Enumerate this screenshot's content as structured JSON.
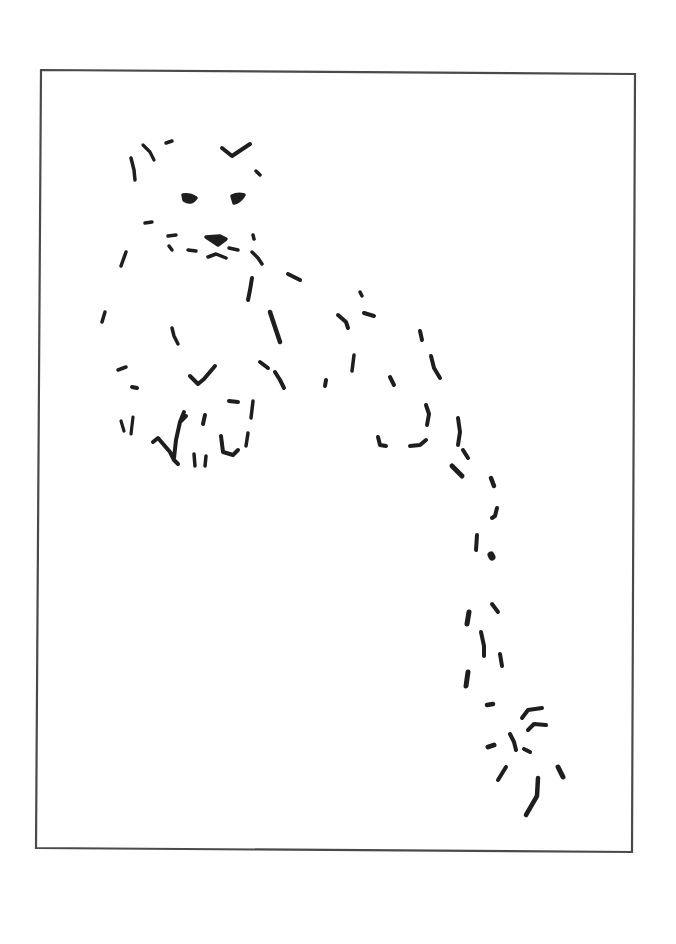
{
  "image": {
    "title": "Minimalist line sketch of a reclining snow leopard",
    "background": "#ffffff",
    "ink_color": "#1e1e1e",
    "frame_color": "#4a4a4a",
    "frame": {
      "points": [
        [
          41,
          70
        ],
        [
          635,
          74
        ],
        [
          632,
          852
        ],
        [
          36,
          848
        ]
      ],
      "stroke_width": 2.2
    },
    "strokes": [
      {
        "part": "ear-left",
        "d": "M131 158 L134 170 L135 180",
        "w": 3.5
      },
      {
        "part": "ear-left-2",
        "d": "M143 145 L150 152 L154 160",
        "w": 3.2
      },
      {
        "part": "ear-left-tip",
        "d": "M166 143 L172 141",
        "w": 3.5
      },
      {
        "part": "ear-right",
        "d": "M222 148 L232 156 L238 152 L250 144",
        "w": 4
      },
      {
        "part": "ear-right-dot",
        "d": "M256 171 L260 175",
        "w": 3.5
      },
      {
        "part": "eye-left",
        "d": "M183 195 Q190 194 196 198 Q191 205 184 200 Z",
        "w": 3.5
      },
      {
        "part": "eye-right",
        "d": "M232 196 Q238 193 244 195 Q240 202 234 203 Z",
        "w": 3.5
      },
      {
        "part": "cheek-dot",
        "d": "M145 223 L152 222",
        "w": 3.5
      },
      {
        "part": "whisker-l1",
        "d": "M168 236 L176 235",
        "w": 3.5
      },
      {
        "part": "whisker-l2",
        "d": "M169 246 L172 250",
        "w": 3.5
      },
      {
        "part": "whisker-l3",
        "d": "M188 250 L196 251",
        "w": 3.5
      },
      {
        "part": "nose",
        "d": "M206 237 L220 236 L226 239 L218 245 L212 241 Z",
        "w": 3.5
      },
      {
        "part": "nose-right",
        "d": "M229 248 L238 250",
        "w": 3.5
      },
      {
        "part": "mouth",
        "d": "M208 257 L216 254 L226 258",
        "w": 3.5
      },
      {
        "part": "whisker-r",
        "d": "M253 235 L254 239",
        "w": 3.5
      },
      {
        "part": "cheek-left",
        "d": "M126 252 L121 266",
        "w": 3.5
      },
      {
        "part": "jaw-right",
        "d": "M252 252 L258 258 L262 264",
        "w": 3.5
      },
      {
        "part": "neck-dot",
        "d": "M288 274 L300 280",
        "w": 4
      },
      {
        "part": "chest-1",
        "d": "M252 278 L250 290 L248 300",
        "w": 4
      },
      {
        "part": "chest-2",
        "d": "M270 312 L276 330 L280 342",
        "w": 4.5
      },
      {
        "part": "side-left",
        "d": "M105 312 L102 322",
        "w": 3.5
      },
      {
        "part": "body-mid",
        "d": "M172 328 L174 336 L178 344",
        "w": 3.5
      },
      {
        "part": "paw-mark-1",
        "d": "M118 370 L126 367",
        "w": 3.5
      },
      {
        "part": "paw-mark-2",
        "d": "M132 387 L137 388",
        "w": 4
      },
      {
        "part": "paw-v",
        "d": "M190 376 L198 384 L204 379 L215 366",
        "w": 4
      },
      {
        "part": "leg-1",
        "d": "M260 362 L268 368",
        "w": 4
      },
      {
        "part": "leg-2",
        "d": "M275 372 L280 380 L284 388",
        "w": 4
      },
      {
        "part": "paw-dash",
        "d": "M229 401 L238 402",
        "w": 4
      },
      {
        "part": "paw-line",
        "d": "M253 401 L251 418",
        "w": 3.5
      },
      {
        "part": "toe-1",
        "d": "M121 421 L124 431",
        "w": 3.2
      },
      {
        "part": "toe-2",
        "d": "M133 417 L131 434",
        "w": 3.2
      },
      {
        "part": "toe-branch",
        "d": "M153 442 L158 438 L164 445 L170 452 L174 460 L178 464 M174 458 L176 440 L180 422 L186 416 M180 422 L184 412",
        "w": 4
      },
      {
        "part": "toe-3",
        "d": "M205 415 L203 424",
        "w": 4
      },
      {
        "part": "toe-4",
        "d": "M194 454 L195 466 M206 456 L205 466",
        "w": 3.5
      },
      {
        "part": "toe-5",
        "d": "M221 436 L223 452 L233 455 L238 450",
        "w": 4
      },
      {
        "part": "toe-6",
        "d": "M248 433 L246 446",
        "w": 3.5
      },
      {
        "part": "back-1",
        "d": "M360 292 L362 296",
        "w": 3.5
      },
      {
        "part": "back-2",
        "d": "M338 315 L346 322 L348 328",
        "w": 4
      },
      {
        "part": "back-3",
        "d": "M364 313 L374 316",
        "w": 4
      },
      {
        "part": "hip-1",
        "d": "M420 331 L422 340",
        "w": 4
      },
      {
        "part": "hip-2",
        "d": "M431 356 L434 368 L440 378",
        "w": 4
      },
      {
        "part": "flank-1",
        "d": "M354 355 L352 371",
        "w": 3.5
      },
      {
        "part": "flank-2",
        "d": "M326 380 L325 386",
        "w": 4
      },
      {
        "part": "flank-3",
        "d": "M390 377 L394 385",
        "w": 4
      },
      {
        "part": "hind-1",
        "d": "M426 405 L429 414 L427 425",
        "w": 4
      },
      {
        "part": "hind-2",
        "d": "M458 418 L460 432 L458 445",
        "w": 4
      },
      {
        "part": "hind-3",
        "d": "M463 450 L468 458",
        "w": 4
      },
      {
        "part": "foot-1",
        "d": "M378 437 L380 445 L386 446",
        "w": 4
      },
      {
        "part": "foot-2",
        "d": "M410 446 L420 445 L426 440",
        "w": 4
      },
      {
        "part": "tail-1",
        "d": "M452 466 L462 476",
        "w": 5
      },
      {
        "part": "tail-2",
        "d": "M491 478 L494 486",
        "w": 4.5
      },
      {
        "part": "tail-3",
        "d": "M497 508 L495 516 L492 518",
        "w": 4
      },
      {
        "part": "tail-4",
        "d": "M477 535 L476 550",
        "w": 4
      },
      {
        "part": "tail-5",
        "d": "M491 555 L492 557",
        "w": 7
      },
      {
        "part": "tail-6",
        "d": "M492 604 L498 612",
        "w": 4
      },
      {
        "part": "tail-7",
        "d": "M469 612 L467 624",
        "w": 5
      },
      {
        "part": "tail-8",
        "d": "M481 632 L484 646 L484 656",
        "w": 4
      },
      {
        "part": "tail-9",
        "d": "M500 654 L502 666",
        "w": 4
      },
      {
        "part": "tail-10",
        "d": "M468 672 L466 686",
        "w": 5
      },
      {
        "part": "tail-11",
        "d": "M487 705 L493 704",
        "w": 4.5
      },
      {
        "part": "tail-tip-1",
        "d": "M522 718 L528 710 L542 708",
        "w": 4
      },
      {
        "part": "tail-tip-2",
        "d": "M528 730 L534 724 L546 725",
        "w": 4
      },
      {
        "part": "tail-tip-3",
        "d": "M510 734 L514 742 L516 750",
        "w": 4
      },
      {
        "part": "tail-tip-4",
        "d": "M488 747 L494 745",
        "w": 5
      },
      {
        "part": "tail-tip-5",
        "d": "M524 749 L530 752",
        "w": 4
      },
      {
        "part": "tail-tip-6",
        "d": "M506 767 L498 780",
        "w": 4
      },
      {
        "part": "tail-tip-7",
        "d": "M558 767 L563 777",
        "w": 5
      },
      {
        "part": "tail-tip-8",
        "d": "M538 778 L537 796 L526 815",
        "w": 4.5
      }
    ]
  }
}
